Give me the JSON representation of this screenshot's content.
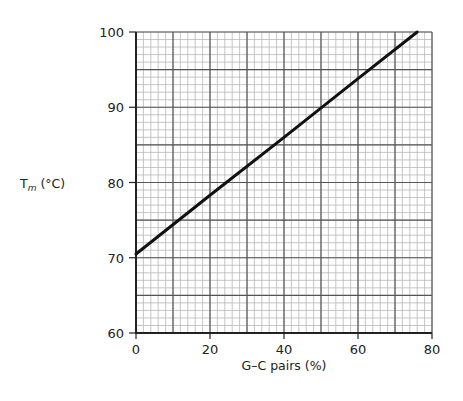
{
  "chart_data": {
    "type": "line",
    "title": "",
    "xlabel": "G–C pairs (%)",
    "ylabel_main": "T",
    "ylabel_sub": "m",
    "ylabel_unit": " (°C)",
    "ylabel": "Tm (°C)",
    "xlim": [
      0,
      80
    ],
    "ylim": [
      60,
      100
    ],
    "x_ticks": [
      0,
      20,
      40,
      60,
      80
    ],
    "y_ticks": [
      60,
      70,
      80,
      90,
      100
    ],
    "grid": {
      "major_x": 10,
      "minor_x": 2,
      "major_y": 5,
      "minor_y": 1
    },
    "legend": null,
    "series": [
      {
        "name": "Tm vs G–C pairs",
        "x": [
          0,
          20,
          40,
          60,
          76
        ],
        "y": [
          70.5,
          78.3,
          86.0,
          93.8,
          100
        ]
      }
    ]
  },
  "colors": {
    "line": "#111111",
    "major_grid": "#555555",
    "minor_grid": "#b8b8b8",
    "axis": "#222222"
  }
}
